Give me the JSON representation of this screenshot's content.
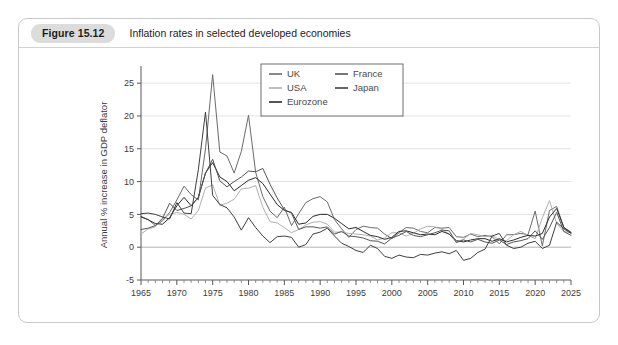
{
  "figure": {
    "badge": "Figure 15.12",
    "caption": "Inflation rates in selected developed economies"
  },
  "chart_data": {
    "type": "line",
    "title": "Inflation rates in selected developed economies",
    "xlabel": "",
    "ylabel": "Annual % increase in GDP deflator",
    "xlim": [
      1965,
      2025
    ],
    "ylim": [
      -5,
      27
    ],
    "yticks": [
      -5,
      0,
      5,
      10,
      15,
      20,
      25
    ],
    "xticks": [
      1965,
      1970,
      1975,
      1980,
      1985,
      1990,
      1995,
      2000,
      2005,
      2010,
      2015,
      2020,
      2025
    ],
    "xtick_labels": [
      "1965",
      "1970",
      "1975",
      "1980",
      "1985",
      "1990",
      "1995",
      "2000",
      "2005",
      "2010",
      "2015",
      "2020",
      "2025"
    ],
    "ytick_labels": [
      "-5",
      "0",
      "5",
      "10",
      "15",
      "20",
      "25"
    ],
    "minor_xtick_interval": 1,
    "grid": "horizontal",
    "legend_position": "top-center",
    "x": [
      1965,
      1966,
      1967,
      1968,
      1969,
      1970,
      1971,
      1972,
      1973,
      1974,
      1975,
      1976,
      1977,
      1978,
      1979,
      1980,
      1981,
      1982,
      1983,
      1984,
      1985,
      1986,
      1987,
      1988,
      1989,
      1990,
      1991,
      1992,
      1993,
      1994,
      1995,
      1996,
      1997,
      1998,
      1999,
      2000,
      2001,
      2002,
      2003,
      2004,
      2005,
      2006,
      2007,
      2008,
      2009,
      2010,
      2011,
      2012,
      2013,
      2014,
      2015,
      2016,
      2017,
      2018,
      2019,
      2020,
      2021,
      2022,
      2023,
      2024,
      2025
    ],
    "series": [
      {
        "name": "UK",
        "color": "#6b6b6b",
        "values": [
          4.7,
          4.2,
          3.3,
          4.0,
          5.3,
          7.2,
          9.3,
          8.0,
          7.2,
          15.0,
          26.3,
          14.5,
          13.9,
          11.3,
          14.6,
          20.1,
          11.4,
          7.7,
          5.5,
          4.5,
          6.1,
          3.3,
          5.1,
          6.8,
          7.4,
          7.7,
          6.9,
          4.2,
          2.8,
          1.5,
          2.7,
          3.2,
          3.0,
          2.9,
          2.0,
          1.3,
          2.2,
          3.0,
          2.9,
          2.4,
          2.2,
          3.0,
          2.9,
          3.0,
          1.6,
          1.5,
          2.0,
          1.6,
          1.8,
          1.6,
          0.5,
          1.9,
          1.9,
          2.1,
          1.9,
          5.5,
          0.2,
          5.6,
          6.2,
          3.0,
          2.3
        ]
      },
      {
        "name": "USA",
        "color": "#b0b0b0",
        "values": [
          2.0,
          2.8,
          3.1,
          4.3,
          5.0,
          5.3,
          5.0,
          4.3,
          5.6,
          9.0,
          9.5,
          6.4,
          6.7,
          7.3,
          8.9,
          9.0,
          9.4,
          6.1,
          3.9,
          3.7,
          3.0,
          2.2,
          2.7,
          3.4,
          3.8,
          3.9,
          3.5,
          2.3,
          2.3,
          2.1,
          2.0,
          1.9,
          1.7,
          1.1,
          1.4,
          2.2,
          2.2,
          1.7,
          2.1,
          2.8,
          3.2,
          3.1,
          2.7,
          2.0,
          0.8,
          1.2,
          2.1,
          1.9,
          1.6,
          1.8,
          1.1,
          1.0,
          1.9,
          2.4,
          1.8,
          1.3,
          4.5,
          7.1,
          3.6,
          2.4,
          2.2
        ]
      },
      {
        "name": "Eurozone",
        "color": "#2b2b2b",
        "values": [
          4.6,
          4.2,
          3.6,
          3.5,
          4.5,
          6.3,
          7.6,
          6.3,
          7.6,
          11.3,
          12.9,
          10.7,
          10.0,
          8.6,
          9.4,
          10.2,
          10.6,
          9.7,
          8.1,
          6.5,
          5.6,
          5.3,
          3.5,
          3.7,
          4.7,
          5.0,
          5.0,
          4.4,
          3.6,
          2.8,
          3.0,
          2.4,
          1.8,
          1.6,
          1.2,
          1.5,
          2.4,
          2.5,
          2.2,
          1.9,
          2.0,
          1.9,
          2.4,
          2.0,
          1.0,
          0.8,
          1.1,
          1.3,
          1.3,
          0.9,
          1.3,
          0.8,
          1.1,
          1.5,
          1.8,
          1.7,
          2.1,
          4.6,
          5.9,
          3.0,
          2.2
        ]
      },
      {
        "name": "France",
        "color": "#555555",
        "values": [
          2.7,
          2.9,
          3.3,
          4.4,
          6.7,
          5.6,
          5.9,
          6.3,
          7.6,
          11.3,
          13.4,
          10.1,
          9.2,
          10.0,
          10.7,
          11.6,
          11.5,
          12.0,
          9.6,
          7.5,
          5.7,
          5.2,
          2.7,
          3.1,
          3.1,
          2.9,
          3.1,
          2.0,
          2.4,
          1.7,
          1.6,
          1.4,
          1.0,
          0.9,
          0.5,
          1.4,
          1.8,
          2.4,
          1.8,
          1.6,
          1.9,
          2.2,
          2.6,
          2.5,
          0.7,
          1.1,
          0.8,
          1.2,
          0.8,
          0.6,
          1.1,
          0.4,
          0.8,
          1.0,
          1.3,
          2.5,
          1.2,
          3.0,
          5.3,
          2.4,
          1.8
        ]
      },
      {
        "name": "Japan",
        "color": "#3f3f3f",
        "values": [
          5.1,
          5.2,
          5.0,
          4.6,
          4.3,
          6.8,
          5.2,
          5.1,
          11.8,
          20.6,
          7.9,
          6.5,
          6.0,
          4.6,
          2.6,
          4.5,
          3.0,
          1.7,
          0.7,
          1.6,
          1.7,
          1.5,
          0.0,
          0.4,
          2.0,
          2.3,
          2.9,
          1.7,
          0.6,
          0.1,
          -0.5,
          -0.8,
          0.3,
          -0.2,
          -1.4,
          -1.7,
          -1.2,
          -1.5,
          -1.6,
          -1.1,
          -1.2,
          -0.9,
          -0.7,
          -1.0,
          -0.5,
          -2.0,
          -1.7,
          -0.8,
          -0.3,
          1.7,
          2.1,
          0.3,
          -0.2,
          0.0,
          0.6,
          0.9,
          -0.2,
          0.3,
          3.8,
          2.8,
          2.1
        ]
      }
    ],
    "legend": [
      {
        "label": "UK",
        "color": "#6b6b6b"
      },
      {
        "label": "USA",
        "color": "#b0b0b0"
      },
      {
        "label": "Eurozone",
        "color": "#2b2b2b"
      },
      {
        "label": "France",
        "color": "#555555"
      },
      {
        "label": "Japan",
        "color": "#3f3f3f"
      }
    ]
  }
}
